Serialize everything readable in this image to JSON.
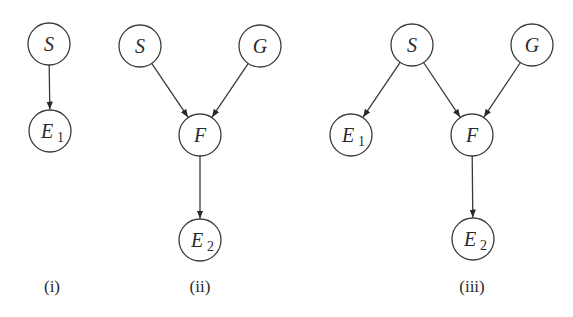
{
  "figure": {
    "node_radius": 21,
    "colors": {
      "stroke": "#3a3a3a",
      "text": "#2a2a2a",
      "background": "#ffffff"
    },
    "panels": [
      {
        "id": "i",
        "label": "(i)",
        "label_pos": [
          52,
          292
        ],
        "nodes": [
          {
            "id": "S",
            "name": "S",
            "sub": "",
            "x": 49,
            "y": 44
          },
          {
            "id": "E1",
            "name": "E",
            "sub": "1",
            "x": 50,
            "y": 131
          }
        ],
        "edges": [
          {
            "from": "S",
            "to": "E1"
          }
        ]
      },
      {
        "id": "ii",
        "label": "(ii)",
        "label_pos": [
          200,
          292
        ],
        "nodes": [
          {
            "id": "S",
            "name": "S",
            "sub": "",
            "x": 140,
            "y": 46
          },
          {
            "id": "G",
            "name": "G",
            "sub": "",
            "x": 260,
            "y": 46
          },
          {
            "id": "F",
            "name": "F",
            "sub": "",
            "x": 200,
            "y": 135
          },
          {
            "id": "E2",
            "name": "E",
            "sub": "2",
            "x": 200,
            "y": 240
          }
        ],
        "edges": [
          {
            "from": "S",
            "to": "F"
          },
          {
            "from": "G",
            "to": "F"
          },
          {
            "from": "F",
            "to": "E2"
          }
        ]
      },
      {
        "id": "iii",
        "label": "(iii)",
        "label_pos": [
          472,
          292
        ],
        "nodes": [
          {
            "id": "S",
            "name": "S",
            "sub": "",
            "x": 412,
            "y": 45
          },
          {
            "id": "G",
            "name": "G",
            "sub": "",
            "x": 532,
            "y": 45
          },
          {
            "id": "E1",
            "name": "E",
            "sub": "1",
            "x": 351,
            "y": 135
          },
          {
            "id": "F",
            "name": "F",
            "sub": "",
            "x": 472,
            "y": 135
          },
          {
            "id": "E2",
            "name": "E",
            "sub": "2",
            "x": 473,
            "y": 239
          }
        ],
        "edges": [
          {
            "from": "S",
            "to": "E1"
          },
          {
            "from": "S",
            "to": "F"
          },
          {
            "from": "G",
            "to": "F"
          },
          {
            "from": "F",
            "to": "E2"
          }
        ]
      }
    ]
  }
}
